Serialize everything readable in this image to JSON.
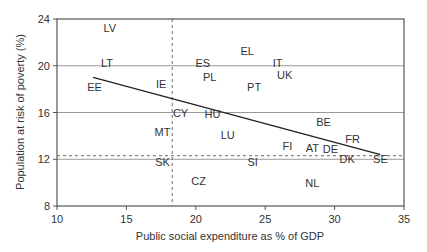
{
  "chart_data": {
    "type": "scatter",
    "title": "",
    "xlabel": "Public social expenditure as % of GDP",
    "ylabel": "Population at risk of poverty (%)",
    "xlim": [
      10,
      35
    ],
    "ylim": [
      8,
      24
    ],
    "xticks": [
      10,
      15,
      20,
      25,
      30,
      35
    ],
    "yticks": [
      8,
      12,
      16,
      20,
      24
    ],
    "grid": {
      "horizontal": [
        12,
        16,
        20
      ],
      "vertical": []
    },
    "reference_lines": {
      "vertical_dashed_x": 18.3,
      "horizontal_dashed_y": 12.3
    },
    "trend_line": {
      "x1": 12.6,
      "y1": 19.0,
      "x2": 33.3,
      "y2": 12.4
    },
    "legend": null,
    "points": [
      {
        "label": "LV",
        "x": 13.8,
        "y": 23.2
      },
      {
        "label": "LT",
        "x": 13.6,
        "y": 20.2
      },
      {
        "label": "EE",
        "x": 12.7,
        "y": 18.2
      },
      {
        "label": "IE",
        "x": 17.5,
        "y": 18.4
      },
      {
        "label": "ES",
        "x": 20.5,
        "y": 20.2
      },
      {
        "label": "PL",
        "x": 21.0,
        "y": 19.0
      },
      {
        "label": "EL",
        "x": 23.7,
        "y": 21.3
      },
      {
        "label": "IT",
        "x": 25.9,
        "y": 20.2
      },
      {
        "label": "UK",
        "x": 26.4,
        "y": 19.2
      },
      {
        "label": "PT",
        "x": 24.2,
        "y": 18.2
      },
      {
        "label": "CY",
        "x": 18.9,
        "y": 16.0
      },
      {
        "label": "HU",
        "x": 21.2,
        "y": 15.9
      },
      {
        "label": "MT",
        "x": 17.6,
        "y": 14.3
      },
      {
        "label": "LU",
        "x": 22.3,
        "y": 14.1
      },
      {
        "label": "BE",
        "x": 29.2,
        "y": 15.2
      },
      {
        "label": "FR",
        "x": 31.3,
        "y": 13.7
      },
      {
        "label": "FI",
        "x": 26.6,
        "y": 13.1
      },
      {
        "label": "AT",
        "x": 28.4,
        "y": 13.0
      },
      {
        "label": "DE",
        "x": 29.7,
        "y": 12.9
      },
      {
        "label": "DK",
        "x": 30.9,
        "y": 12.0
      },
      {
        "label": "SE",
        "x": 33.3,
        "y": 12.0
      },
      {
        "label": "SK",
        "x": 17.6,
        "y": 11.8
      },
      {
        "label": "SI",
        "x": 24.1,
        "y": 11.8
      },
      {
        "label": "CZ",
        "x": 20.2,
        "y": 10.1
      },
      {
        "label": "NL",
        "x": 28.4,
        "y": 10.0
      }
    ],
    "colors": {
      "axis": "#555555",
      "grid": "#999999",
      "text": "#333333",
      "trend": "#222222"
    }
  }
}
